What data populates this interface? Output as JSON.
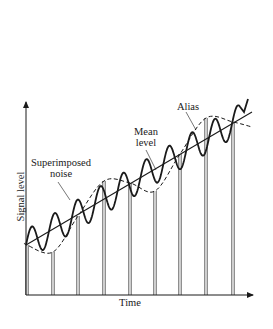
{
  "diagram": {
    "type": "signal-aliasing",
    "axes": {
      "x_label": "Time",
      "y_label": "Signal level"
    },
    "annotations": {
      "noise": "Superimposed noise",
      "noise_line1": "Superimposed",
      "noise_line2": "noise",
      "mean_line1": "Mean",
      "mean_line2": "level",
      "alias": "Alias"
    },
    "geometry": {
      "origin": [
        26,
        295
      ],
      "y_axis_top": [
        26,
        102
      ],
      "x_axis_end": [
        253,
        295
      ],
      "mean_line": [
        [
          26,
          245
        ],
        [
          252,
          112
        ]
      ],
      "sample_x": [
        27,
        53,
        78,
        104,
        130,
        155,
        180,
        206,
        233
      ],
      "sample_y": [
        245,
        252,
        216,
        181,
        183,
        191,
        154,
        118,
        122
      ]
    },
    "colors": {
      "ink": "#1a1a1a",
      "background": "#ffffff"
    }
  }
}
